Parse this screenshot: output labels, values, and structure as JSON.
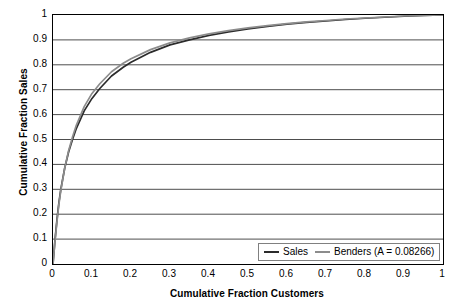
{
  "chart_data": {
    "type": "line",
    "title": "",
    "xlabel": "Cumulative Fraction Customers",
    "ylabel": "Cumulative Fraction Sales",
    "xlim": [
      0,
      1
    ],
    "ylim": [
      0,
      1
    ],
    "grid": "horizontal",
    "legend_position": "bottom-right",
    "x_ticks": [
      "0",
      "0.1",
      "0.2",
      "0.3",
      "0.4",
      "0.5",
      "0.6",
      "0.7",
      "0.8",
      "0.9",
      "1"
    ],
    "y_ticks": [
      "0",
      "0.1",
      "0.2",
      "0.3",
      "0.4",
      "0.5",
      "0.6",
      "0.7",
      "0.8",
      "0.9",
      "1"
    ],
    "x_tick_values": [
      0,
      0.1,
      0.2,
      0.3,
      0.4,
      0.5,
      0.6,
      0.7,
      0.8,
      0.9,
      1
    ],
    "y_tick_values": [
      0,
      0.1,
      0.2,
      0.3,
      0.4,
      0.5,
      0.6,
      0.7,
      0.8,
      0.9,
      1
    ],
    "x": [
      0,
      0.005,
      0.01,
      0.015,
      0.02,
      0.03,
      0.04,
      0.05,
      0.06,
      0.08,
      0.1,
      0.12,
      0.15,
      0.18,
      0.2,
      0.25,
      0.3,
      0.35,
      0.4,
      0.45,
      0.5,
      0.55,
      0.6,
      0.65,
      0.7,
      0.75,
      0.8,
      0.85,
      0.9,
      0.95,
      1
    ],
    "series": [
      {
        "name": "Sales",
        "color": "#2b2b2b",
        "values": [
          0,
          0.095,
          0.175,
          0.245,
          0.3,
          0.385,
          0.45,
          0.5,
          0.545,
          0.615,
          0.665,
          0.705,
          0.755,
          0.79,
          0.81,
          0.85,
          0.88,
          0.9,
          0.918,
          0.932,
          0.944,
          0.954,
          0.963,
          0.97,
          0.976,
          0.982,
          0.987,
          0.991,
          0.995,
          0.998,
          1
        ]
      },
      {
        "name": "Benders (A = 0.08266)",
        "color": "#8c8c8c",
        "values": [
          0,
          0.09,
          0.168,
          0.238,
          0.295,
          0.385,
          0.455,
          0.51,
          0.558,
          0.632,
          0.685,
          0.724,
          0.772,
          0.806,
          0.824,
          0.861,
          0.888,
          0.908,
          0.924,
          0.937,
          0.948,
          0.957,
          0.965,
          0.972,
          0.978,
          0.984,
          0.988,
          0.992,
          0.996,
          0.998,
          1
        ]
      }
    ],
    "legend": [
      {
        "label": "Sales",
        "color": "#2b2b2b"
      },
      {
        "label": "Benders (A = 0.08266)",
        "color": "#8c8c8c"
      }
    ],
    "annotations": {
      "benders_A": "0.08266"
    }
  }
}
